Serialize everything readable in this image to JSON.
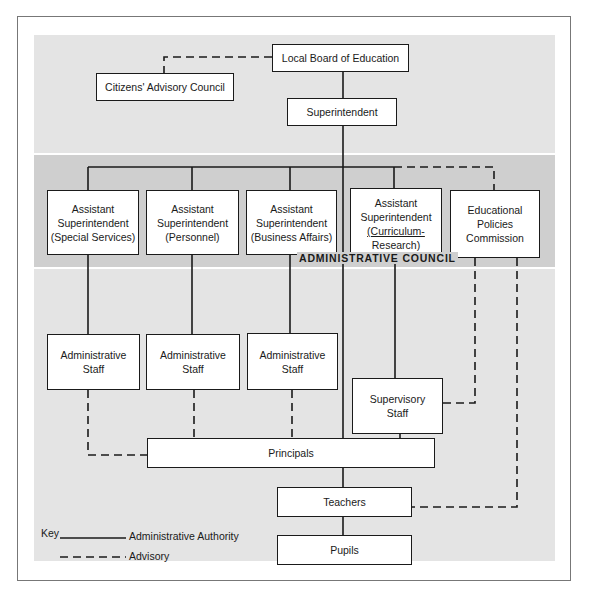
{
  "diagram": {
    "type": "organizational-chart",
    "bands": {
      "administrative_council_label": "ADMINISTRATIVE COUNCIL"
    },
    "nodes": {
      "local_board": "Local Board of Education",
      "citizens_council": "Citizens' Advisory Council",
      "superintendent": "Superintendent",
      "asst_special": "Assistant Superintendent (Special Services)",
      "asst_personnel": "Assistant Superintendent (Personnel)",
      "asst_business": "Assistant Superintendent (Business Affairs)",
      "asst_curriculum": "Assistant Superintendent (Curriculum-Research)",
      "edu_policies": "Educational Policies Commission",
      "admin_staff_1": "Administrative Staff",
      "admin_staff_2": "Administrative Staff",
      "admin_staff_3": "Administrative Staff",
      "supervisory_staff": "Supervisory Staff",
      "principals": "Principals",
      "teachers": "Teachers",
      "pupils": "Pupils"
    },
    "edges": [
      {
        "from": "local_board",
        "to": "citizens_council",
        "type": "advisory"
      },
      {
        "from": "local_board",
        "to": "superintendent",
        "type": "authority"
      },
      {
        "from": "superintendent",
        "to": "asst_special",
        "type": "authority"
      },
      {
        "from": "superintendent",
        "to": "asst_personnel",
        "type": "authority"
      },
      {
        "from": "superintendent",
        "to": "asst_business",
        "type": "authority"
      },
      {
        "from": "superintendent",
        "to": "asst_curriculum",
        "type": "authority"
      },
      {
        "from": "superintendent",
        "to": "edu_policies",
        "type": "advisory"
      },
      {
        "from": "superintendent",
        "to": "principals",
        "type": "authority"
      },
      {
        "from": "asst_special",
        "to": "admin_staff_1",
        "type": "authority"
      },
      {
        "from": "asst_personnel",
        "to": "admin_staff_2",
        "type": "authority"
      },
      {
        "from": "asst_business",
        "to": "admin_staff_3",
        "type": "authority"
      },
      {
        "from": "asst_curriculum",
        "to": "supervisory_staff",
        "type": "authority"
      },
      {
        "from": "edu_policies",
        "to": "supervisory_staff",
        "type": "advisory"
      },
      {
        "from": "edu_policies",
        "to": "teachers",
        "type": "advisory"
      },
      {
        "from": "admin_staff_1",
        "to": "principals",
        "type": "advisory"
      },
      {
        "from": "admin_staff_2",
        "to": "principals",
        "type": "advisory"
      },
      {
        "from": "admin_staff_3",
        "to": "principals",
        "type": "advisory"
      },
      {
        "from": "supervisory_staff",
        "to": "principals",
        "type": "advisory"
      },
      {
        "from": "principals",
        "to": "teachers",
        "type": "authority"
      },
      {
        "from": "teachers",
        "to": "pupils",
        "type": "authority"
      }
    ],
    "key": {
      "title": "Key",
      "solid": "Administrative Authority",
      "dashed": "Advisory"
    }
  },
  "labels": {
    "asst_special": [
      "Assistant",
      "Superintendent",
      "(Special Services)"
    ],
    "asst_personnel": [
      "Assistant",
      "Superintendent",
      "(Personnel)"
    ],
    "asst_business": [
      "Assistant",
      "Superintendent",
      "(Business Affairs)"
    ],
    "asst_curriculum": [
      "Assistant",
      "Superintendent",
      "(Curriculum-",
      "Research)"
    ],
    "edu_policies": [
      "Educational",
      "Policies",
      "Commission"
    ],
    "admin_staff": [
      "Administrative",
      "Staff"
    ],
    "supervisory_staff": [
      "Supervisory",
      "Staff"
    ]
  }
}
